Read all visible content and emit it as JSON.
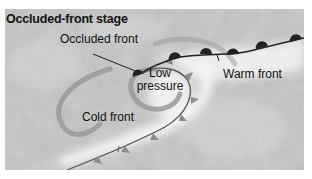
{
  "diagram": {
    "title": "Occluded-front stage",
    "labels": {
      "occluded_front": "Occluded front",
      "low_pressure_line1": "Low",
      "low_pressure_line2": "pressure",
      "warm_front": "Warm front",
      "cold_front": "Cold front"
    },
    "colors": {
      "background": "#b9b9b9",
      "cloud": "#f2f2f2",
      "front_line": "#333333",
      "warm_symbols": "#222222",
      "cold_symbols": "#8a8a8a",
      "arrow": "#9a9a9a"
    }
  }
}
